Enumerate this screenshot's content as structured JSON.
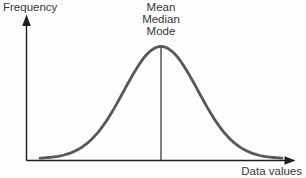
{
  "figure": {
    "y_axis_label": "Frequency",
    "x_axis_label": "Data values",
    "peak_labels": [
      "Mean",
      "Median",
      "Mode"
    ],
    "colors": {
      "axis": "#1f1f1f",
      "curve": "#585858",
      "center_line": "#2e2e2e",
      "text": "#383838",
      "background": "#fdfdfd"
    }
  },
  "chart_data": {
    "type": "line",
    "title": "",
    "xlabel": "Data values",
    "ylabel": "Frequency",
    "annotations": [
      "Mean",
      "Median",
      "Mode"
    ],
    "axes": {
      "origin": [
        26.5,
        160.5
      ],
      "x_arrow_tip": [
        295.5,
        160.5
      ],
      "y_arrow_tip": [
        26.5,
        15
      ]
    },
    "curve": {
      "shape": "gaussian",
      "mu": 161,
      "sigma": 37,
      "x_start": 40,
      "x_end": 283,
      "baseline_y": 158.6,
      "peak_top_y": 46.5
    }
  }
}
